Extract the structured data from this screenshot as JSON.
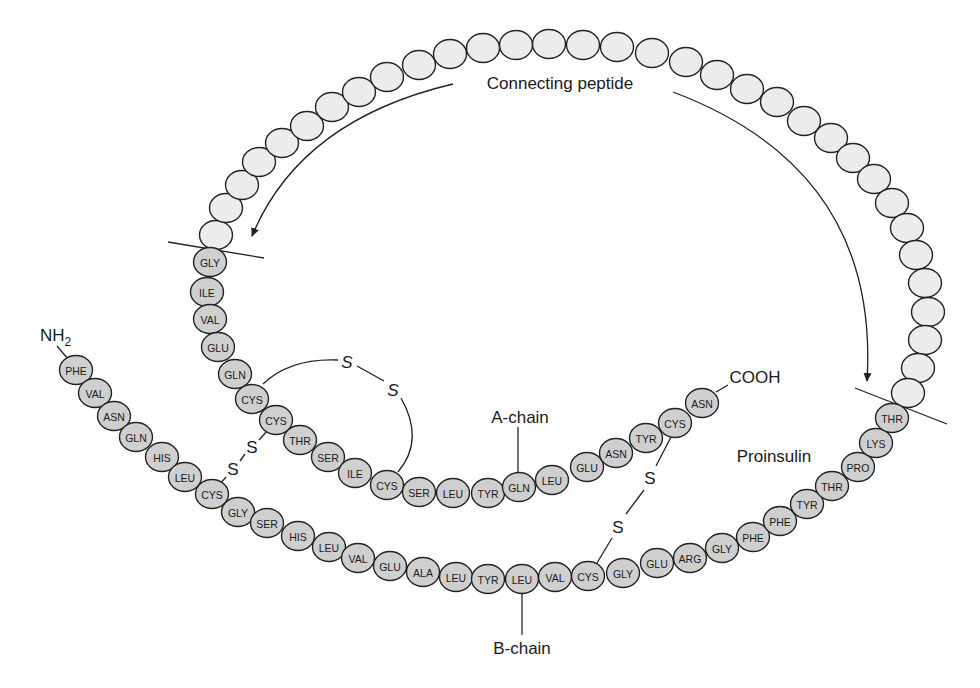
{
  "title": "Proinsulin",
  "labels": {
    "connecting_peptide": "Connecting peptide",
    "a_chain": "A-chain",
    "b_chain": "B-chain",
    "proinsulin": "Proinsulin",
    "nh2": "NH",
    "nh2_sub": "2",
    "cooh": "COOH",
    "sulfur": "S"
  },
  "colors": {
    "labeled_residue_fill": "#cfcfcf",
    "peptide_residue_fill": "#ececec",
    "stroke": "#222222"
  },
  "connecting_peptide_residues": [
    [
      216,
      235
    ],
    [
      226,
      208
    ],
    [
      242,
      185
    ],
    [
      259,
      162
    ],
    [
      282,
      143
    ],
    [
      307,
      126
    ],
    [
      332,
      107
    ],
    [
      359,
      92
    ],
    [
      387,
      77
    ],
    [
      419,
      65
    ],
    [
      450,
      54
    ],
    [
      483,
      48
    ],
    [
      516,
      45
    ],
    [
      549,
      44
    ],
    [
      583,
      45
    ],
    [
      617,
      47
    ],
    [
      652,
      53
    ],
    [
      686,
      62
    ],
    [
      717,
      75
    ],
    [
      747,
      89
    ],
    [
      777,
      102
    ],
    [
      804,
      121
    ],
    [
      831,
      138
    ],
    [
      853,
      158
    ],
    [
      874,
      179
    ],
    [
      892,
      203
    ],
    [
      907,
      228
    ],
    [
      916,
      255
    ],
    [
      925,
      283
    ],
    [
      928,
      312
    ],
    [
      925,
      340
    ],
    [
      918,
      368
    ],
    [
      908,
      393
    ]
  ],
  "a_chain": [
    {
      "name": "GLY",
      "x": 210,
      "y": 262
    },
    {
      "name": "ILE",
      "x": 207,
      "y": 292
    },
    {
      "name": "VAL",
      "x": 210,
      "y": 319
    },
    {
      "name": "GLU",
      "x": 218,
      "y": 347
    },
    {
      "name": "GLN",
      "x": 235,
      "y": 374
    },
    {
      "name": "CYS",
      "x": 252,
      "y": 399
    },
    {
      "name": "CYS",
      "x": 276,
      "y": 420
    },
    {
      "name": "THR",
      "x": 300,
      "y": 440
    },
    {
      "name": "SER",
      "x": 328,
      "y": 457
    },
    {
      "name": "ILE",
      "x": 355,
      "y": 473
    },
    {
      "name": "CYS",
      "x": 387,
      "y": 485
    },
    {
      "name": "SER",
      "x": 419,
      "y": 492
    },
    {
      "name": "LEU",
      "x": 453,
      "y": 493
    },
    {
      "name": "TYR",
      "x": 488,
      "y": 493
    },
    {
      "name": "GLN",
      "x": 519,
      "y": 487
    },
    {
      "name": "LEU",
      "x": 552,
      "y": 480
    },
    {
      "name": "GLU",
      "x": 587,
      "y": 467
    },
    {
      "name": "ASN",
      "x": 616,
      "y": 453
    },
    {
      "name": "TYR",
      "x": 646,
      "y": 438
    },
    {
      "name": "CYS",
      "x": 675,
      "y": 423
    },
    {
      "name": "ASN",
      "x": 702,
      "y": 403
    }
  ],
  "b_chain": [
    {
      "name": "PHE",
      "x": 76,
      "y": 370
    },
    {
      "name": "VAL",
      "x": 95,
      "y": 393
    },
    {
      "name": "ASN",
      "x": 114,
      "y": 416
    },
    {
      "name": "GLN",
      "x": 136,
      "y": 437
    },
    {
      "name": "HIS",
      "x": 162,
      "y": 457
    },
    {
      "name": "LEU",
      "x": 185,
      "y": 477
    },
    {
      "name": "CYS",
      "x": 212,
      "y": 494
    },
    {
      "name": "GLY",
      "x": 238,
      "y": 512
    },
    {
      "name": "SER",
      "x": 267,
      "y": 523
    },
    {
      "name": "HIS",
      "x": 298,
      "y": 536
    },
    {
      "name": "LEU",
      "x": 329,
      "y": 547
    },
    {
      "name": "VAL",
      "x": 358,
      "y": 558
    },
    {
      "name": "GLU",
      "x": 390,
      "y": 566
    },
    {
      "name": "ALA",
      "x": 423,
      "y": 572
    },
    {
      "name": "LEU",
      "x": 456,
      "y": 577
    },
    {
      "name": "TYR",
      "x": 488,
      "y": 579
    },
    {
      "name": "LEU",
      "x": 522,
      "y": 579
    },
    {
      "name": "VAL",
      "x": 555,
      "y": 577
    },
    {
      "name": "CYS",
      "x": 588,
      "y": 576
    },
    {
      "name": "GLY",
      "x": 623,
      "y": 573
    },
    {
      "name": "GLU",
      "x": 657,
      "y": 563
    },
    {
      "name": "ARG",
      "x": 690,
      "y": 558
    },
    {
      "name": "GLY",
      "x": 722,
      "y": 548
    },
    {
      "name": "PHE",
      "x": 753,
      "y": 537
    },
    {
      "name": "PHE",
      "x": 780,
      "y": 521
    },
    {
      "name": "TYR",
      "x": 807,
      "y": 504
    },
    {
      "name": "THR",
      "x": 832,
      "y": 486
    },
    {
      "name": "PRO",
      "x": 858,
      "y": 467
    },
    {
      "name": "LYS",
      "x": 876,
      "y": 443
    },
    {
      "name": "THR",
      "x": 892,
      "y": 418
    }
  ],
  "disulfide_bonds": [
    {
      "id": "intra-a",
      "s1": [
        347,
        362
      ],
      "s2": [
        393,
        390
      ]
    },
    {
      "id": "a7-b7",
      "s1": [
        252,
        447
      ],
      "s2": [
        233,
        469
      ]
    },
    {
      "id": "a20-b19",
      "s1": [
        650,
        478
      ],
      "s2": [
        618,
        527
      ]
    }
  ]
}
